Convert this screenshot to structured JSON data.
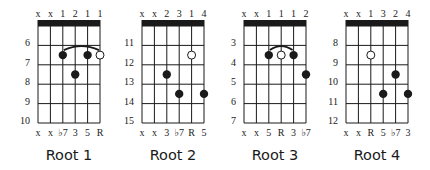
{
  "figure": {
    "background": "#ffffff",
    "ink": "#1a1a1a",
    "strings": 6,
    "frets_shown": 5,
    "diagrams": [
      {
        "title": "Root 1",
        "fingering": [
          "x",
          "x",
          "1",
          "2",
          "1",
          "1"
        ],
        "fret_labels": [
          "6",
          "7",
          "8",
          "9",
          "10"
        ],
        "intervals": [
          "x",
          "x",
          "♭7",
          "3",
          "5",
          "R"
        ],
        "notes": [
          {
            "string": 3,
            "fret_row": 2,
            "type": "filled"
          },
          {
            "string": 5,
            "fret_row": 2,
            "type": "filled"
          },
          {
            "string": 6,
            "fret_row": 2,
            "type": "open"
          },
          {
            "string": 4,
            "fret_row": 3,
            "type": "filled"
          }
        ],
        "barre": {
          "from_string": 3,
          "to_string": 6,
          "fret_row": 2
        }
      },
      {
        "title": "Root 2",
        "fingering": [
          "x",
          "x",
          "2",
          "3",
          "1",
          "4"
        ],
        "fret_labels": [
          "11",
          "12",
          "13",
          "14",
          "15"
        ],
        "intervals": [
          "x",
          "x",
          "3",
          "♭7",
          "R",
          "5"
        ],
        "notes": [
          {
            "string": 5,
            "fret_row": 2,
            "type": "open"
          },
          {
            "string": 3,
            "fret_row": 3,
            "type": "filled"
          },
          {
            "string": 4,
            "fret_row": 4,
            "type": "filled"
          },
          {
            "string": 6,
            "fret_row": 4,
            "type": "filled"
          }
        ],
        "barre": null
      },
      {
        "title": "Root 3",
        "fingering": [
          "x",
          "x",
          "1",
          "1",
          "1",
          "2"
        ],
        "fret_labels": [
          "3",
          "4",
          "5",
          "6",
          "7"
        ],
        "intervals": [
          "x",
          "x",
          "5",
          "R",
          "3",
          "♭7"
        ],
        "notes": [
          {
            "string": 3,
            "fret_row": 2,
            "type": "filled"
          },
          {
            "string": 4,
            "fret_row": 2,
            "type": "open"
          },
          {
            "string": 5,
            "fret_row": 2,
            "type": "filled"
          },
          {
            "string": 6,
            "fret_row": 3,
            "type": "filled"
          }
        ],
        "barre": {
          "from_string": 3,
          "to_string": 5,
          "fret_row": 2
        }
      },
      {
        "title": "Root 4",
        "fingering": [
          "x",
          "x",
          "1",
          "3",
          "2",
          "4"
        ],
        "fret_labels": [
          "8",
          "9",
          "10",
          "11",
          "12"
        ],
        "intervals": [
          "x",
          "x",
          "R",
          "5",
          "♭7",
          "3"
        ],
        "notes": [
          {
            "string": 3,
            "fret_row": 2,
            "type": "open"
          },
          {
            "string": 5,
            "fret_row": 3,
            "type": "filled"
          },
          {
            "string": 4,
            "fret_row": 4,
            "type": "filled"
          },
          {
            "string": 6,
            "fret_row": 4,
            "type": "filled"
          }
        ],
        "barre": null
      }
    ]
  }
}
